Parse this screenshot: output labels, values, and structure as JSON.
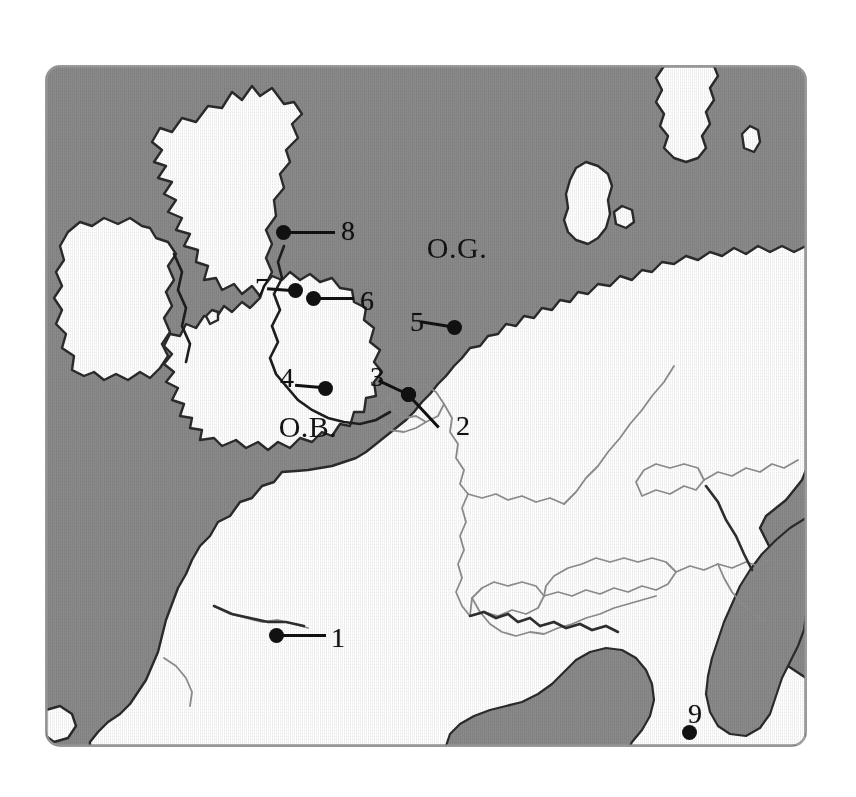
{
  "figure": {
    "kind": "reference-map",
    "region_description": "Western and Central Europe, North Sea and English Channel",
    "background_color": "#ffffff"
  },
  "map": {
    "sea_color": "#8a8a8a",
    "land_color": "#ffffff",
    "coast_color": "#2b2b2b",
    "border_color": "#8c8c8c",
    "frame": {
      "x": 46,
      "y": 66,
      "width": 760,
      "height": 680,
      "corner_radius": 14
    }
  },
  "sea_labels": [
    {
      "id": "og",
      "text": "O.G.",
      "x": 457,
      "y": 248,
      "name": "sea-label-og"
    },
    {
      "id": "ob",
      "text": "O.B.",
      "x": 308,
      "y": 427,
      "name": "sea-label-ob"
    }
  ],
  "markers": [
    {
      "id": "m1",
      "label": "1",
      "dot_x": 276,
      "dot_y": 635,
      "label_x": 338,
      "label_y": 638,
      "leader_x": 282,
      "leader_y": 635,
      "leader_len": 44,
      "leader_angle": 0
    },
    {
      "id": "m2",
      "label": "2",
      "dot_x": 408,
      "dot_y": 394,
      "label_x": 463,
      "label_y": 426,
      "leader_x": 408,
      "leader_y": 394,
      "leader_len": 45,
      "leader_angle": 47
    },
    {
      "id": "m3",
      "label": "3",
      "dot_x": 408,
      "dot_y": 394,
      "label_x": 377,
      "label_y": 377,
      "leader_x": 404,
      "leader_y": 392,
      "leader_len": 28,
      "leader_angle": 205
    },
    {
      "id": "m4",
      "label": "4",
      "dot_x": 325,
      "dot_y": 388,
      "label_x": 287,
      "label_y": 378,
      "leader_x": 321,
      "leader_y": 387,
      "leader_len": 26,
      "leader_angle": 185
    },
    {
      "id": "m5",
      "label": "5",
      "dot_x": 454,
      "dot_y": 327,
      "label_x": 417,
      "label_y": 322,
      "leader_x": 450,
      "leader_y": 326,
      "leader_len": 30,
      "leader_angle": 189
    },
    {
      "id": "m6",
      "label": "6",
      "dot_x": 313,
      "dot_y": 298,
      "label_x": 367,
      "label_y": 301,
      "leader_x": 318,
      "leader_y": 298,
      "leader_len": 36,
      "leader_angle": 0
    },
    {
      "id": "m7",
      "label": "7",
      "dot_x": 295,
      "dot_y": 290,
      "label_x": 262,
      "label_y": 288,
      "leader_x": 291,
      "leader_y": 290,
      "leader_len": 24,
      "leader_angle": 184
    },
    {
      "id": "m8",
      "label": "8",
      "dot_x": 283,
      "dot_y": 232,
      "label_x": 348,
      "label_y": 231,
      "leader_x": 288,
      "leader_y": 232,
      "leader_len": 47,
      "leader_angle": 0
    },
    {
      "id": "m9",
      "label": "9",
      "dot_x": 689,
      "dot_y": 732,
      "label_x": 695,
      "label_y": 714,
      "leader_x": 689,
      "leader_y": 729,
      "leader_len": 0,
      "leader_angle": 0
    }
  ]
}
